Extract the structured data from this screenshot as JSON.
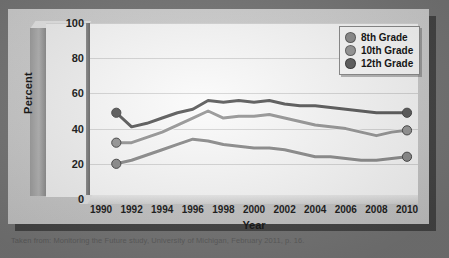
{
  "caption": "Taken from: Monitoring the Future study, University of Michigan, February 2011, p. 16.",
  "legend": {
    "position": "top-right",
    "items": [
      {
        "label": "8th Grade",
        "color": "#8f8f8f"
      },
      {
        "label": "10th Grade",
        "color": "#9a9a9a"
      },
      {
        "label": "12th Grade",
        "color": "#5f5f5f"
      }
    ]
  },
  "chart_data": {
    "type": "line",
    "title": "",
    "subtitle": "",
    "xlabel": "Year",
    "ylabel": "Percent",
    "ylim": [
      0,
      100
    ],
    "xlim": [
      1990,
      2010
    ],
    "ytick_labels": [
      "0",
      "20",
      "40",
      "60",
      "80",
      "100"
    ],
    "yticks": [
      0,
      20,
      40,
      60,
      80,
      100
    ],
    "xtick_labels": [
      "1990",
      "1992",
      "1994",
      "1996",
      "1998",
      "2000",
      "2002",
      "2004",
      "2006",
      "2008",
      "2010"
    ],
    "xticks": [
      1990,
      1992,
      1994,
      1996,
      1998,
      2000,
      2002,
      2004,
      2006,
      2008,
      2010
    ],
    "grid": true,
    "x": [
      1991,
      1992,
      1993,
      1994,
      1995,
      1996,
      1997,
      1998,
      1999,
      2000,
      2001,
      2002,
      2003,
      2004,
      2005,
      2006,
      2007,
      2008,
      2009,
      2010
    ],
    "series": [
      {
        "name": "8th Grade",
        "color": "#8f8f8f",
        "marker": "circle",
        "markers_at_ends": true,
        "values": [
          20,
          22,
          25,
          28,
          31,
          34,
          33,
          31,
          30,
          29,
          29,
          28,
          26,
          24,
          24,
          23,
          22,
          22,
          23,
          24
        ]
      },
      {
        "name": "10th Grade",
        "color": "#9a9a9a",
        "marker": "circle",
        "markers_at_ends": true,
        "values": [
          32,
          32,
          35,
          38,
          42,
          46,
          50,
          46,
          47,
          47,
          48,
          46,
          44,
          42,
          41,
          40,
          38,
          36,
          38,
          39
        ]
      },
      {
        "name": "12th Grade",
        "color": "#5f5f5f",
        "marker": "circle",
        "markers_at_ends": true,
        "values": [
          49,
          41,
          43,
          46,
          49,
          51,
          56,
          55,
          56,
          55,
          56,
          54,
          53,
          53,
          52,
          51,
          50,
          49,
          49,
          49
        ]
      }
    ]
  }
}
